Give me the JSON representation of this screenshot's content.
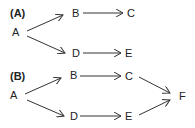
{
  "panels": [
    {
      "label": "(A)",
      "nodes": [
        {
          "id": "A",
          "text": "A",
          "x": 15,
          "y": 36
        },
        {
          "id": "B",
          "text": "B",
          "x": 76,
          "y": 17
        },
        {
          "id": "C",
          "text": "C",
          "x": 131,
          "y": 17
        },
        {
          "id": "D",
          "text": "D",
          "x": 76,
          "y": 57
        },
        {
          "id": "E",
          "text": "E",
          "x": 128,
          "y": 57
        }
      ],
      "edges": [
        [
          "A",
          "B"
        ],
        [
          "A",
          "D"
        ],
        [
          "B",
          "C"
        ],
        [
          "D",
          "E"
        ]
      ]
    },
    {
      "label": "(B)",
      "nodes": [
        {
          "id": "A",
          "text": "A",
          "x": 13,
          "y": 99
        },
        {
          "id": "B",
          "text": "B",
          "x": 73,
          "y": 79
        },
        {
          "id": "C",
          "text": "C",
          "x": 128,
          "y": 80
        },
        {
          "id": "D",
          "text": "D",
          "x": 73,
          "y": 120
        },
        {
          "id": "E",
          "text": "E",
          "x": 128,
          "y": 120
        },
        {
          "id": "F",
          "text": "F",
          "x": 181,
          "y": 100
        }
      ],
      "edges": [
        [
          "A",
          "B"
        ],
        [
          "A",
          "D"
        ],
        [
          "B",
          "C"
        ],
        [
          "D",
          "E"
        ],
        [
          "C",
          "F"
        ],
        [
          "E",
          "F"
        ]
      ]
    }
  ]
}
